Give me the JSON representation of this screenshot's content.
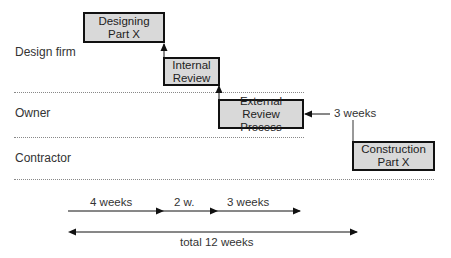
{
  "lanes": [
    {
      "label": "Design firm"
    },
    {
      "label": "Owner"
    },
    {
      "label": "Contractor"
    }
  ],
  "tasks": [
    {
      "label": "Designing Part X",
      "lane": "Design firm"
    },
    {
      "label": "Internal Review",
      "lane": "Design firm"
    },
    {
      "label": "External Review Process",
      "lane": "Owner"
    },
    {
      "label": "Construction Part X",
      "lane": "Contractor"
    }
  ],
  "annotation": {
    "label": "3 weeks"
  },
  "durations": [
    {
      "label": "4 weeks"
    },
    {
      "label": "2 w."
    },
    {
      "label": "3 weeks"
    }
  ],
  "total": {
    "label": "total 12 weeks"
  },
  "colors": {
    "box_fill": "#d9d9d9",
    "box_border": "#111111",
    "divider": "#888888"
  }
}
